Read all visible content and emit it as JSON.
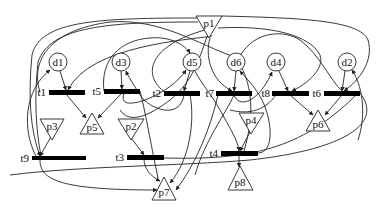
{
  "diagram": {
    "type": "petri-net",
    "stroke_color": "#222222",
    "transition_color": "#000000",
    "places_circle": [
      {
        "id": "d1",
        "label": "d1",
        "cx": 58,
        "cy": 62
      },
      {
        "id": "d3",
        "label": "d3",
        "cx": 121,
        "cy": 62
      },
      {
        "id": "d5",
        "label": "d5",
        "cx": 192,
        "cy": 62
      },
      {
        "id": "d6",
        "label": "d6",
        "cx": 236,
        "cy": 62
      },
      {
        "id": "d4",
        "label": "d4",
        "cx": 276,
        "cy": 62
      },
      {
        "id": "d2",
        "label": "d2",
        "cx": 347,
        "cy": 62
      }
    ],
    "places_triangle_down": [
      {
        "id": "p1",
        "label": "p1"
      },
      {
        "id": "p3",
        "label": "p3"
      },
      {
        "id": "p2",
        "label": "p2"
      },
      {
        "id": "p4",
        "label": "p4"
      }
    ],
    "places_triangle_up": [
      {
        "id": "p5",
        "label": "p5"
      },
      {
        "id": "p6",
        "label": "p6"
      },
      {
        "id": "p7",
        "label": "p7"
      },
      {
        "id": "p8",
        "label": "p8"
      }
    ],
    "transitions": [
      {
        "id": "t1",
        "label": "t1"
      },
      {
        "id": "t5",
        "label": "t5"
      },
      {
        "id": "t2",
        "label": "t2"
      },
      {
        "id": "t7",
        "label": "t7"
      },
      {
        "id": "t8",
        "label": "t8"
      },
      {
        "id": "t6",
        "label": "t6"
      },
      {
        "id": "t9",
        "label": "t9"
      },
      {
        "id": "t3",
        "label": "t3"
      },
      {
        "id": "t4",
        "label": "t4"
      }
    ],
    "arcs": [
      {
        "from": "d1",
        "to": "t1"
      },
      {
        "from": "d3",
        "to": "t5"
      },
      {
        "from": "d5",
        "to": "t2"
      },
      {
        "from": "d6",
        "to": "t7"
      },
      {
        "from": "d4",
        "to": "t8"
      },
      {
        "from": "d2",
        "to": "t6"
      },
      {
        "from": "t1",
        "to": "p5"
      },
      {
        "from": "t5",
        "to": "p5"
      },
      {
        "from": "t8",
        "to": "p6"
      },
      {
        "from": "t6",
        "to": "p6"
      },
      {
        "from": "p3",
        "to": "t9"
      },
      {
        "from": "p2",
        "to": "t3"
      },
      {
        "from": "p4",
        "to": "t4"
      },
      {
        "from": "t4",
        "to": "p8"
      },
      {
        "from": "t9",
        "to": "p7"
      },
      {
        "from": "t3",
        "to": "p7"
      },
      {
        "from": "t9",
        "to": "d1"
      },
      {
        "from": "t5",
        "to": "d5"
      },
      {
        "from": "t2",
        "to": "d3"
      },
      {
        "from": "t7",
        "to": "d4"
      },
      {
        "from": "t4",
        "to": "d6"
      },
      {
        "from": "p1",
        "to": "t1"
      },
      {
        "from": "p1",
        "to": "t9"
      },
      {
        "from": "p1",
        "to": "t6"
      },
      {
        "from": "p1",
        "to": "t8"
      },
      {
        "from": "p1",
        "to": "t7"
      },
      {
        "from": "p1",
        "to": "t2"
      }
    ]
  }
}
